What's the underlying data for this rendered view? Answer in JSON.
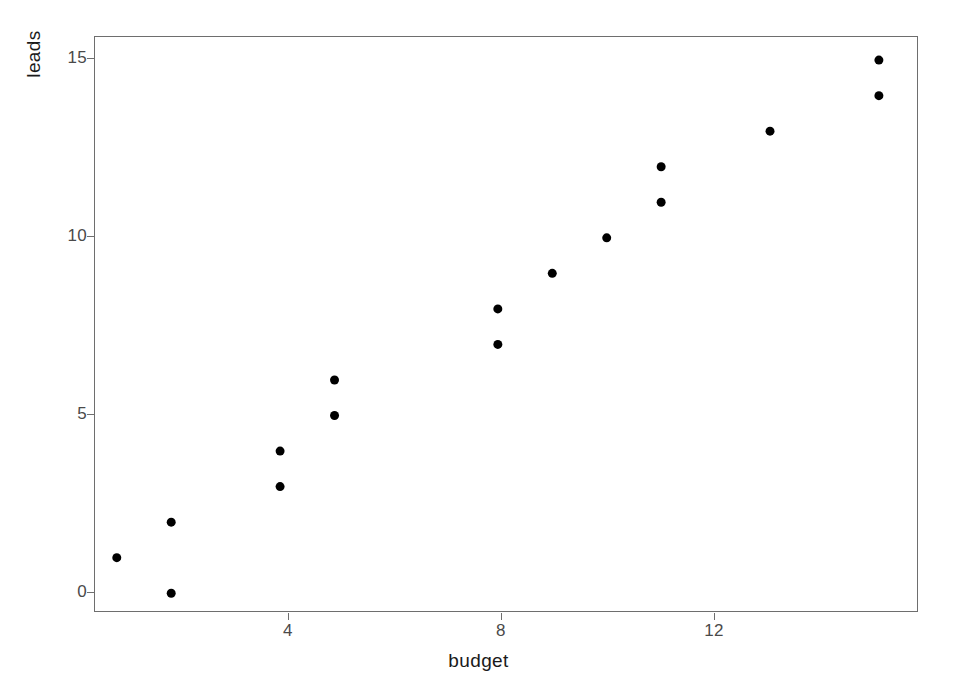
{
  "figure": {
    "background_color": "#ffffff",
    "panel_border_color": "#6e6e6e",
    "point_color": "#000000",
    "tick_color": "#6e6e6e",
    "tick_label_color": "#4a4a4a",
    "axis_title_color": "#1a1a1a"
  },
  "axes": {
    "x_title": "budget",
    "y_title": "leads",
    "x_ticks": [
      "4",
      "8",
      "12"
    ],
    "y_ticks": [
      "0",
      "5",
      "10",
      "15"
    ]
  },
  "chart_data": {
    "type": "scatter",
    "title": "",
    "xlabel": "budget",
    "ylabel": "leads",
    "xlim": [
      0.6,
      15.7
    ],
    "ylim": [
      -0.5,
      15.65
    ],
    "xticks": [
      4,
      8,
      12
    ],
    "yticks": [
      0,
      5,
      10,
      15
    ],
    "grid": false,
    "legend": false,
    "marker": "filled-circle",
    "marker_color": "#000000",
    "marker_size_px": 9,
    "series": [
      {
        "name": "leads vs budget",
        "points": [
          {
            "x": 1,
            "y": 1
          },
          {
            "x": 2,
            "y": 2
          },
          {
            "x": 2,
            "y": 0
          },
          {
            "x": 4,
            "y": 4
          },
          {
            "x": 4,
            "y": 3
          },
          {
            "x": 5,
            "y": 6
          },
          {
            "x": 5,
            "y": 5
          },
          {
            "x": 8,
            "y": 8
          },
          {
            "x": 8,
            "y": 7
          },
          {
            "x": 9,
            "y": 9
          },
          {
            "x": 10,
            "y": 10
          },
          {
            "x": 11,
            "y": 12
          },
          {
            "x": 11,
            "y": 11
          },
          {
            "x": 13,
            "y": 13
          },
          {
            "x": 15,
            "y": 15
          },
          {
            "x": 15,
            "y": 14
          }
        ]
      }
    ],
    "x": [
      1,
      2,
      2,
      4,
      4,
      5,
      5,
      8,
      8,
      9,
      10,
      11,
      11,
      13,
      15,
      15
    ],
    "y": [
      1,
      2,
      0,
      4,
      3,
      6,
      5,
      8,
      7,
      9,
      10,
      12,
      11,
      13,
      15,
      14
    ]
  }
}
